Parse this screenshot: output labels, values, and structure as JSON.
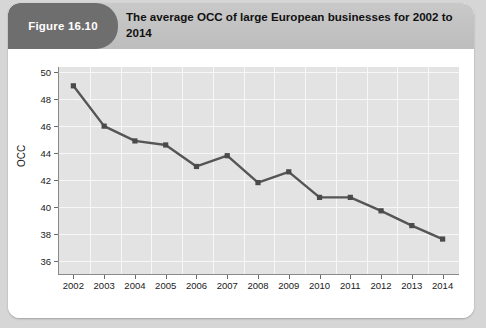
{
  "figure": {
    "badge_label": "Figure 16.10",
    "title": "The average OCC of large European businesses for 2002 to 2014",
    "badge_color": "#6e6e6e",
    "header_color": "#c2c2c2",
    "card_color": "#ffffff",
    "page_color": "#d6d6d6"
  },
  "chart_data": {
    "type": "line",
    "title": "The average OCC of large European businesses for 2002 to 2014",
    "xlabel": "",
    "ylabel": "OCC",
    "categories": [
      "2002",
      "2003",
      "2004",
      "2005",
      "2006",
      "2007",
      "2008",
      "2009",
      "2010",
      "2011",
      "2012",
      "2013",
      "2014"
    ],
    "values": [
      49.0,
      46.0,
      44.9,
      44.6,
      43.0,
      43.8,
      41.8,
      42.6,
      40.7,
      40.7,
      39.7,
      38.6,
      37.6
    ],
    "ylim": [
      35.0,
      50.4
    ],
    "yticks": [
      36,
      38,
      40,
      42,
      44,
      46,
      48,
      50
    ],
    "ytick_labels": [
      "36",
      "38",
      "40",
      "42",
      "44",
      "46",
      "48",
      "50"
    ],
    "grid": true,
    "legend": false,
    "marker": "square",
    "line_color": "#555555",
    "marker_color": "#4a4a4a",
    "plot_bg_color": "#e3e3e3",
    "gridline_color": "#f7f7f7"
  }
}
